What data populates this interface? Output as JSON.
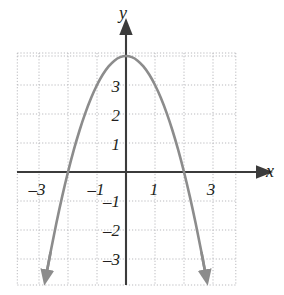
{
  "figure": {
    "kind": "cartesian-plot",
    "background_color": "#ffffff"
  },
  "axes": {
    "x_axis_label": "x",
    "y_axis_label": "y",
    "axis_color": "#3b3b3b",
    "grid_color": "#b9b9bd",
    "grid_style": "dotted",
    "x_tick_labels": [
      "–3",
      "–1",
      "1",
      "3"
    ],
    "x_tick_values": [
      -3,
      -1,
      1,
      3
    ],
    "y_tick_labels": [
      "3",
      "2",
      "1",
      "–1",
      "–2",
      "–3"
    ],
    "y_tick_values": [
      3,
      2,
      1,
      -1,
      -2,
      -3
    ],
    "xlim": [
      -3.75,
      3.75
    ],
    "ylim": [
      -3.9,
      4.1
    ]
  },
  "chart_data": {
    "type": "line",
    "title": "",
    "xlabel": "x",
    "ylabel": "y",
    "grid": true,
    "legend": "none",
    "xlim": [
      -3.75,
      3.75
    ],
    "ylim": [
      -3.9,
      4.1
    ],
    "xticks": [
      -3,
      -1,
      1,
      3
    ],
    "yticks": [
      3,
      2,
      1,
      -1,
      -2,
      -3
    ],
    "series": [
      {
        "name": "parabola",
        "equation": "y = 4 - x^2",
        "color": "#8c8c8c",
        "vertex": [
          0,
          4
        ],
        "x_intercepts": [
          -2,
          2
        ],
        "y_intercept": 4,
        "opens": "down",
        "arrowheads": [
          "start",
          "end"
        ],
        "x": [
          -2.73,
          -2.6,
          -2.4,
          -2.2,
          -2.0,
          -1.8,
          -1.6,
          -1.4,
          -1.2,
          -1.0,
          -0.8,
          -0.6,
          -0.4,
          -0.2,
          0.0,
          0.2,
          0.4,
          0.6,
          0.8,
          1.0,
          1.2,
          1.4,
          1.6,
          1.8,
          2.0,
          2.2,
          2.4,
          2.6,
          2.73
        ],
        "y": [
          -3.45,
          -2.76,
          -1.76,
          -0.84,
          0.0,
          0.76,
          1.44,
          2.04,
          2.56,
          3.0,
          3.36,
          3.64,
          3.84,
          3.96,
          4.0,
          3.96,
          3.84,
          3.64,
          3.36,
          3.0,
          2.56,
          2.04,
          1.44,
          0.76,
          0.0,
          -0.84,
          -1.76,
          -2.76,
          -3.45
        ]
      }
    ]
  }
}
